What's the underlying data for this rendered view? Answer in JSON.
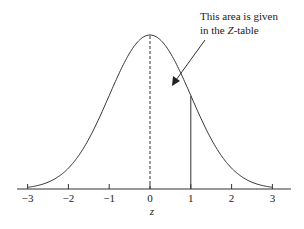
{
  "chart_data": {
    "type": "line",
    "title": "",
    "xlabel": "z",
    "ylabel": "",
    "xlim": [
      -3,
      3
    ],
    "x_ticks": [
      -3,
      -2,
      -1,
      0,
      1,
      2,
      3
    ],
    "x_tick_labels": [
      "−3",
      "−2",
      "−1",
      "0",
      "1",
      "2",
      "3"
    ],
    "series": [
      {
        "name": "standard normal density",
        "function": "exp(-z^2/2)/sqrt(2*pi)"
      }
    ],
    "reference_lines": [
      {
        "x": 0,
        "style": "dashed",
        "from": "axis",
        "to": "curve"
      },
      {
        "x": 1,
        "style": "solid",
        "from": "axis",
        "to": "curve"
      }
    ],
    "annotation": {
      "line1": "This area is given",
      "line2_prefix": "in the ",
      "line2_italic": "Z",
      "line2_suffix": "-table",
      "arrow_points_to": "area between z=0 and z=1"
    },
    "grid": false,
    "legend": "none"
  }
}
